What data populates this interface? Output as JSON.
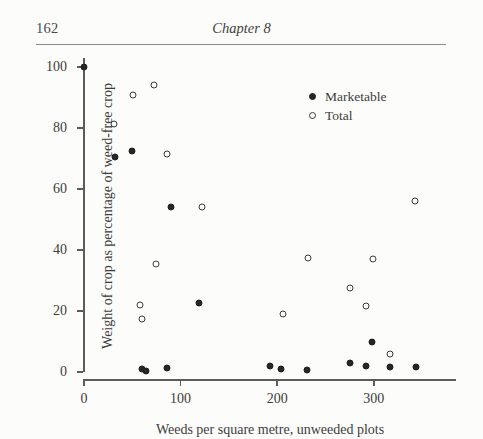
{
  "page": {
    "folio": "162",
    "running_head": "Chapter 8",
    "ink_color": "#3a3a3a",
    "paper_color": "#fcfcfa"
  },
  "legend": {
    "position": "inside-top-right",
    "entries": [
      {
        "marker": "filled-circle-icon",
        "label": "Marketable",
        "color": "#262626"
      },
      {
        "marker": "open-circle-icon",
        "label": "Total",
        "color": "#3a3a3a"
      }
    ]
  },
  "chart_data": {
    "type": "scatter",
    "title": "",
    "xlabel": "Weeds per square metre, unweeded plots",
    "ylabel": "Weight of crop as percentage of weed-free crop",
    "xlim": [
      0,
      385
    ],
    "ylim": [
      0,
      103
    ],
    "grid": false,
    "xticks": [
      0,
      100,
      200,
      300
    ],
    "yticks": [
      0,
      20,
      40,
      60,
      80,
      100
    ],
    "xtick_labels": [
      "0",
      "100",
      "200",
      "300"
    ],
    "ytick_labels": [
      "0",
      "20",
      "40",
      "60",
      "80",
      "100"
    ],
    "series": [
      {
        "name": "Marketable",
        "marker": "filled-circle",
        "color": "#262626",
        "points": [
          [
            0,
            100
          ],
          [
            32,
            70.5
          ],
          [
            50,
            72.5
          ],
          [
            60,
            1.0
          ],
          [
            64,
            0.3
          ],
          [
            86,
            1.2
          ],
          [
            90,
            54
          ],
          [
            119,
            22.5
          ],
          [
            192,
            2.0
          ],
          [
            204,
            1.0
          ],
          [
            231,
            0.8
          ],
          [
            275,
            3.0
          ],
          [
            292,
            2.0
          ],
          [
            298,
            10.0
          ],
          [
            317,
            1.8
          ],
          [
            344,
            1.8
          ]
        ]
      },
      {
        "name": "Total",
        "marker": "open-circle",
        "color": "#3a3a3a",
        "points": [
          [
            31,
            81.5
          ],
          [
            51,
            91.0
          ],
          [
            58,
            22.0
          ],
          [
            60,
            17.5
          ],
          [
            72,
            94.0
          ],
          [
            74,
            35.5
          ],
          [
            86,
            71.5
          ],
          [
            122,
            54.0
          ],
          [
            206,
            19.0
          ],
          [
            232,
            37.5
          ],
          [
            275,
            27.5
          ],
          [
            292,
            21.5
          ],
          [
            299,
            37.0
          ],
          [
            317,
            6.0
          ],
          [
            343,
            56.0
          ]
        ]
      }
    ]
  }
}
